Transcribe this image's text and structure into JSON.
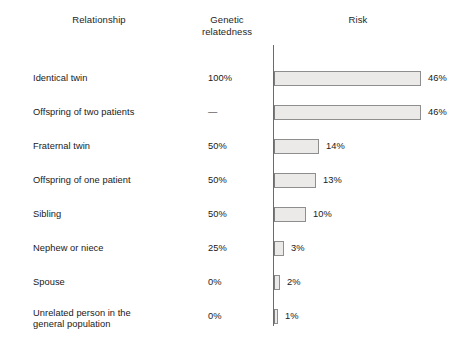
{
  "headers": {
    "relationship": "Relationship",
    "genetic_relatedness": "Genetic\nrelatedness",
    "risk": "Risk"
  },
  "colors": {
    "bar_fill": "#eceae9",
    "bar_stroke": "#8e8e8e",
    "axis": "#6b6b6b",
    "text": "#191919",
    "background": "#ffffff"
  },
  "chart_data": {
    "type": "bar",
    "title": "",
    "subtitle": "",
    "xlabel": "Risk",
    "ylabel": "Relationship",
    "orientation": "horizontal",
    "grid": false,
    "legend": null,
    "xlim": [
      0,
      50
    ],
    "units": "percent",
    "categories": [
      "Identical twin",
      "Offspring of two patients",
      "Fraternal twin",
      "Offspring of one patient",
      "Sibling",
      "Nephew or niece",
      "Spouse",
      "Unrelated person in the general population"
    ],
    "values": [
      46,
      46,
      14,
      13,
      10,
      3,
      2,
      1
    ],
    "value_labels": [
      "46%",
      "46%",
      "14%",
      "13%",
      "10%",
      "3%",
      "2%",
      "1%"
    ],
    "genetic_relatedness": [
      "100%",
      "—",
      "50%",
      "50%",
      "50%",
      "25%",
      "0%",
      "0%"
    ]
  },
  "rows": [
    {
      "label": "Identical twin",
      "label_line1": "Identical twin",
      "label_line2": "",
      "relatedness": "100%",
      "risk_label": "46%",
      "risk_value": 46
    },
    {
      "label": "Offspring of two patients",
      "label_line1": "Offspring of two patients",
      "label_line2": "",
      "relatedness": "—",
      "risk_label": "46%",
      "risk_value": 46
    },
    {
      "label": "Fraternal twin",
      "label_line1": "Fraternal twin",
      "label_line2": "",
      "relatedness": "50%",
      "risk_label": "14%",
      "risk_value": 14
    },
    {
      "label": "Offspring of one patient",
      "label_line1": "Offspring of one patient",
      "label_line2": "",
      "relatedness": "50%",
      "risk_label": "13%",
      "risk_value": 13
    },
    {
      "label": "Sibling",
      "label_line1": "Sibling",
      "label_line2": "",
      "relatedness": "50%",
      "risk_label": "10%",
      "risk_value": 10
    },
    {
      "label": "Nephew or niece",
      "label_line1": "Nephew or niece",
      "label_line2": "",
      "relatedness": "25%",
      "risk_label": "3%",
      "risk_value": 3
    },
    {
      "label": "Spouse",
      "label_line1": "Spouse",
      "label_line2": "",
      "relatedness": "0%",
      "risk_label": "2%",
      "risk_value": 2
    },
    {
      "label": "Unrelated person in the general population",
      "label_line1": "Unrelated person in the",
      "label_line2": "general population",
      "relatedness": "0%",
      "risk_label": "1%",
      "risk_value": 1
    }
  ],
  "layout": {
    "row_tops": [
      71,
      105,
      139,
      173,
      207,
      241,
      275,
      309
    ],
    "px_per_percent": 3.2,
    "axis_left": 273
  }
}
